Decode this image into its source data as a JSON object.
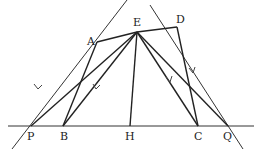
{
  "diagram": {
    "type": "geometry",
    "points": {
      "P": {
        "label": "P",
        "x": 31,
        "y": 126
      },
      "B": {
        "label": "B",
        "x": 63,
        "y": 126
      },
      "H": {
        "label": "H",
        "x": 130,
        "y": 126
      },
      "C": {
        "label": "C",
        "x": 198,
        "y": 126
      },
      "Q": {
        "label": "Q",
        "x": 228,
        "y": 126
      },
      "A": {
        "label": "A",
        "x": 97,
        "y": 42
      },
      "E": {
        "label": "E",
        "x": 137,
        "y": 32
      },
      "D": {
        "label": "D",
        "x": 177,
        "y": 27
      }
    },
    "segments": [
      [
        "A",
        "B"
      ],
      [
        "A",
        "E"
      ],
      [
        "E",
        "D"
      ],
      [
        "D",
        "C"
      ],
      [
        "E",
        "B"
      ],
      [
        "E",
        "H"
      ],
      [
        "E",
        "C"
      ],
      [
        "E",
        "P"
      ],
      [
        "E",
        "Q"
      ]
    ],
    "lines": [
      {
        "name": "line-through-P-A",
        "from": [
          12,
          149
        ],
        "to": [
          127,
          0
        ]
      },
      {
        "name": "line-through-Q-D",
        "from": [
          150,
          5
        ],
        "to": [
          243,
          149
        ]
      },
      {
        "name": "baseline",
        "from": [
          8,
          126
        ],
        "to": [
          254,
          126
        ]
      }
    ],
    "parallel_marks": [
      {
        "on": "line-through-P-A",
        "x": 38,
        "y": 86
      },
      {
        "on": "E-B",
        "x": 97,
        "y": 86
      },
      {
        "on": "E-C",
        "x": 170,
        "y": 80
      },
      {
        "on": "line-through-Q-D",
        "x": 193,
        "y": 70
      }
    ],
    "stroke_color": "#333333"
  }
}
